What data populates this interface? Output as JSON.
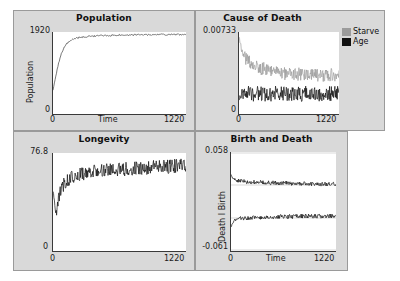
{
  "figure": {
    "background": "#d9d9d9",
    "plot_background": "#ffffff",
    "axis_color": "#3a3a3a"
  },
  "panels": [
    {
      "id": "population",
      "title": "Population",
      "ylabel": "Population",
      "xlabel": "Time",
      "ytick_max": "1920",
      "ytick_min": "0",
      "xtick_min": "0",
      "xtick_max": "1220"
    },
    {
      "id": "cause-of-death",
      "title": "Cause of Death",
      "ylabel": "",
      "xlabel": "",
      "ytick_max": "0.00733",
      "ytick_min": "0",
      "xtick_min": "0",
      "xtick_max": "1220",
      "legend": [
        {
          "label": "Starve",
          "color": "#9b9b9b"
        },
        {
          "label": "Age",
          "color": "#111111"
        }
      ]
    },
    {
      "id": "longevity",
      "title": "Longevity",
      "ylabel": "",
      "xlabel": "",
      "ytick_max": "76.8",
      "ytick_min": "0",
      "xtick_min": "0",
      "xtick_max": "1220"
    },
    {
      "id": "birth-and-death",
      "title": "Birth and Death",
      "ylabel": "Death I Birth",
      "xlabel": "Time",
      "ytick_max": "0.058",
      "ytick_min": "-0.061",
      "xtick_min": "0",
      "xtick_max": "1220"
    }
  ],
  "chart_data": [
    {
      "type": "line",
      "id": "population",
      "title": "Population",
      "xlabel": "Time",
      "ylabel": "Population",
      "xlim": [
        0,
        1220
      ],
      "ylim": [
        0,
        1920
      ],
      "grid": false,
      "legend": null,
      "series": [
        {
          "name": "Population",
          "color": "#444444",
          "description": "Rapid logistic rise from ~560 at t=0 to a noisy plateau near 1820-1870 after t~200",
          "x": [
            0,
            25,
            50,
            75,
            100,
            125,
            150,
            175,
            200,
            250,
            300,
            350,
            400,
            450,
            500,
            550,
            600,
            650,
            700,
            750,
            800,
            850,
            900,
            950,
            1000,
            1050,
            1100,
            1150,
            1220
          ],
          "values": [
            560,
            880,
            1180,
            1400,
            1545,
            1640,
            1700,
            1740,
            1768,
            1795,
            1812,
            1820,
            1828,
            1833,
            1838,
            1842,
            1845,
            1848,
            1850,
            1852,
            1853,
            1855,
            1856,
            1858,
            1859,
            1860,
            1861,
            1862,
            1863
          ],
          "noise_amplitude": 18
        }
      ]
    },
    {
      "type": "line",
      "id": "cause-of-death",
      "title": "Cause of Death",
      "xlabel": "",
      "ylabel": "",
      "xlim": [
        0,
        1220
      ],
      "ylim": [
        0,
        0.00733
      ],
      "grid": false,
      "legend": {
        "position": "outside-top-right",
        "entries": [
          "Starve",
          "Age"
        ]
      },
      "series": [
        {
          "name": "Starve",
          "color": "#9b9b9b",
          "description": "Starts high near 0.0070 at t=0, decays to a noisy band around 0.0033-0.0038",
          "x": [
            0,
            20,
            40,
            60,
            90,
            120,
            160,
            200,
            260,
            320,
            400,
            500,
            600,
            700,
            800,
            900,
            1000,
            1100,
            1220
          ],
          "values": [
            0.007,
            0.0061,
            0.0055,
            0.0052,
            0.0049,
            0.0047,
            0.0045,
            0.0043,
            0.0041,
            0.004,
            0.0038,
            0.0037,
            0.0036,
            0.0036,
            0.0035,
            0.0035,
            0.0035,
            0.0035,
            0.0035
          ],
          "noise_amplitude": 0.0006
        },
        {
          "name": "Age",
          "color": "#111111",
          "description": "Flat noisy band around 0.0016-0.0020 across the whole run",
          "x": [
            0,
            20,
            40,
            60,
            90,
            120,
            160,
            200,
            260,
            320,
            400,
            500,
            600,
            700,
            800,
            900,
            1000,
            1100,
            1220
          ],
          "values": [
            0.0014,
            0.0017,
            0.0018,
            0.0018,
            0.0018,
            0.0018,
            0.0018,
            0.0018,
            0.0018,
            0.0018,
            0.0018,
            0.0018,
            0.0018,
            0.0018,
            0.0018,
            0.0018,
            0.0018,
            0.0018,
            0.0018
          ],
          "noise_amplitude": 0.0007
        }
      ]
    },
    {
      "type": "line",
      "id": "longevity",
      "title": "Longevity",
      "xlabel": "",
      "ylabel": "",
      "xlim": [
        0,
        1220
      ],
      "ylim": [
        0,
        76.8
      ],
      "grid": false,
      "legend": null,
      "series": [
        {
          "name": "Longevity",
          "color": "#111111",
          "description": "Dips to ~28 near t=30 then climbs and settles into a very noisy band around 60-70",
          "x": [
            0,
            15,
            30,
            50,
            80,
            120,
            180,
            250,
            350,
            450,
            550,
            650,
            750,
            850,
            950,
            1050,
            1150,
            1220
          ],
          "values": [
            47,
            36,
            29,
            40,
            50,
            55,
            58,
            60,
            62,
            63,
            64,
            64,
            65,
            65,
            66,
            66,
            67,
            67
          ],
          "noise_amplitude": 5.5
        }
      ]
    },
    {
      "type": "line",
      "id": "birth-and-death",
      "title": "Birth and Death",
      "xlabel": "Time",
      "ylabel": "Death I Birth",
      "xlim": [
        0,
        1220
      ],
      "ylim": [
        -0.061,
        0.058
      ],
      "grid": true,
      "legend": null,
      "series": [
        {
          "name": "Birth",
          "color": "#111111",
          "description": "Upper trace: starts ~0.030 and decays to a flat noisy band near 0.019",
          "x": [
            0,
            20,
            40,
            70,
            110,
            170,
            250,
            350,
            450,
            550,
            650,
            750,
            850,
            950,
            1050,
            1150,
            1220
          ],
          "values": [
            0.031,
            0.027,
            0.025,
            0.024,
            0.023,
            0.0225,
            0.022,
            0.0215,
            0.021,
            0.021,
            0.0205,
            0.02,
            0.02,
            0.0195,
            0.0195,
            0.0195,
            0.0195
          ],
          "noise_amplitude": 0.0025
        },
        {
          "name": "Death",
          "color": "#111111",
          "description": "Lower trace: starts ~-0.031 and rises to a flat noisy band near -0.019",
          "x": [
            0,
            20,
            40,
            70,
            110,
            170,
            250,
            350,
            450,
            550,
            650,
            750,
            850,
            950,
            1050,
            1150,
            1220
          ],
          "values": [
            -0.032,
            -0.027,
            -0.024,
            -0.023,
            -0.022,
            -0.0215,
            -0.021,
            -0.0205,
            -0.02,
            -0.02,
            -0.0195,
            -0.0195,
            -0.019,
            -0.019,
            -0.019,
            -0.019,
            -0.019
          ],
          "noise_amplitude": 0.0026
        }
      ]
    }
  ]
}
